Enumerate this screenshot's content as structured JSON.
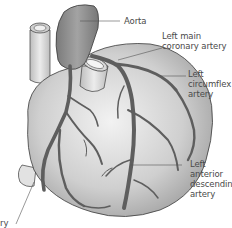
{
  "diagram": {
    "labels": [
      {
        "id": "aorta",
        "lines": [
          "Aorta"
        ]
      },
      {
        "id": "left-main-coronary-artery",
        "lines": [
          "Left main",
          "coronary artery"
        ]
      },
      {
        "id": "left-circumflex-artery",
        "lines": [
          "Left",
          "circumflex",
          "artery"
        ]
      },
      {
        "id": "left-anterior-descending-artery",
        "lines": [
          "Left",
          "anterior",
          "descending",
          "artery"
        ]
      },
      {
        "id": "right-coronary-artery",
        "lines": [
          "ry"
        ]
      }
    ],
    "colors": {
      "heart_fill": "#dcdcdc",
      "heart_shade": "#9a9a9a",
      "aorta_fill": "#8e8e8e",
      "artery_fill": "#6e6e6e",
      "outline": "#3a3a3a",
      "leader_line": "#555555",
      "text": "#4a4a4a"
    }
  }
}
